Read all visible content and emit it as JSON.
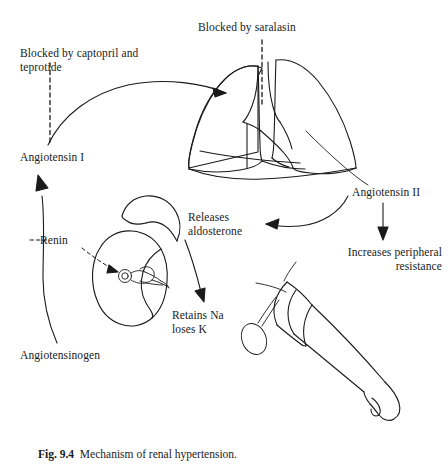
{
  "figure": {
    "caption_label": "Fig. 9.4",
    "caption_text": "Mechanism of renal hypertension.",
    "ink_color": "#1a1a1a",
    "background_color": "#ffffff"
  },
  "labels": {
    "blocked_captopril": "Blocked by captopril and\nteprotide",
    "blocked_saralasin": "Blocked by saralasin",
    "angiotensin_i": "Angiotensin I",
    "angiotensin_ii": "Angiotensin II",
    "angiotensinogen": "Angiotensinogen",
    "renin": "Renin",
    "releases_aldosterone": "Releases\naldosterone",
    "retains_na_loses_k": "Retains Na\nloses K",
    "increases_peripheral": "Increases peripheral",
    "increases_peripheral_line2": "resistance"
  },
  "anatomy": {
    "lungs": "lungs-illustration",
    "kidney": "kidney-illustration",
    "adrenal_gland": "adrenal-gland-illustration",
    "glomerulus": "glomerulus-detail",
    "arm_cuff": "arm-with-blood-pressure-cuff-illustration"
  },
  "flow": {
    "angiotensinogen_to_angiotensin_i": "renin-conversion-arrow",
    "angiotensin_i_to_lungs": "ace-conversion-arrow",
    "lungs_to_angiotensin_ii": "angiotensin-ii-leader-line",
    "angiotensin_ii_to_adrenal": "aldosterone-release-arrow",
    "angiotensin_ii_to_resistance": "peripheral-resistance-arrow",
    "adrenal_to_sodium": "sodium-retention-arrow",
    "captopril_block": "captopril-block-marker",
    "saralasin_block": "saralasin-block-marker"
  }
}
